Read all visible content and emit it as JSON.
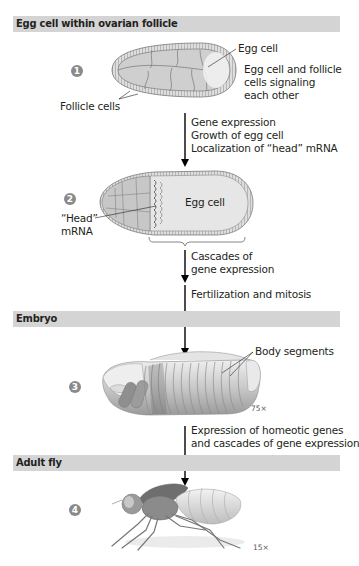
{
  "sections": [
    {
      "id": "egg",
      "title": "Egg cell within ovarian follicle"
    },
    {
      "id": "embryo",
      "title": "Embryo"
    },
    {
      "id": "adult",
      "title": "Adult fly"
    }
  ],
  "steps": [
    {
      "number": "1"
    },
    {
      "number": "2"
    },
    {
      "number": "3"
    },
    {
      "number": "4"
    }
  ],
  "labels": {
    "egg_cell_1": "Egg cell",
    "signaling_line1": "Egg cell and follicle",
    "signaling_line2": "cells signaling",
    "signaling_line3": "each other",
    "follicle_cells": "Follicle cells",
    "egg_cell_2": "Egg cell",
    "head_mrna_line1": "“Head”",
    "head_mrna_line2": "mRNA",
    "body_segments": "Body segments"
  },
  "processes": {
    "p1_line1": "Gene expression",
    "p1_line2": "Growth of egg cell",
    "p1_line3": "Localization of “head” mRNA",
    "p2_line1": "Cascades of",
    "p2_line2": "gene expression",
    "p3_line1": "Fertilization and mitosis",
    "p4_line1": "Expression of homeotic genes",
    "p4_line2": "and cascades of gene expression"
  },
  "magnifications": {
    "embryo": "75×",
    "adult": "15×"
  },
  "colors": {
    "bar": "#d4d4d4",
    "step_circle": "#8a8a8a",
    "cell_fill": "#cfcfcf",
    "arrow": "#000000"
  }
}
